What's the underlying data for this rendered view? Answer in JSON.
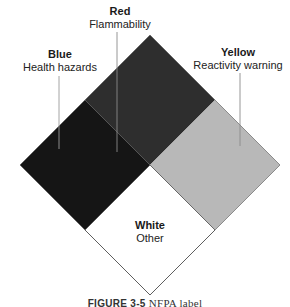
{
  "diagram": {
    "title": "NFPA label",
    "quadrants": [
      {
        "id": "red",
        "name": "Red",
        "meaning": "Flammability",
        "position": "top",
        "fill": "#2e2e2e"
      },
      {
        "id": "blue",
        "name": "Blue",
        "meaning": "Health hazards",
        "position": "left",
        "fill": "#151515"
      },
      {
        "id": "yellow",
        "name": "Yellow",
        "meaning": "Reactivity warning",
        "position": "right",
        "fill": "#b8b8b8"
      },
      {
        "id": "white",
        "name": "White",
        "meaning": "Other",
        "position": "bottom",
        "fill": "#ffffff"
      }
    ]
  },
  "labels": {
    "red": {
      "title": "Red",
      "sub": "Flammability"
    },
    "blue": {
      "title": "Blue",
      "sub": "Health hazards"
    },
    "yellow": {
      "title": "Yellow",
      "sub": "Reactivity warning"
    },
    "white": {
      "title": "White",
      "sub": "Other"
    }
  },
  "caption": {
    "figure": "FIGURE 3-5",
    "text": "NFPA label"
  }
}
